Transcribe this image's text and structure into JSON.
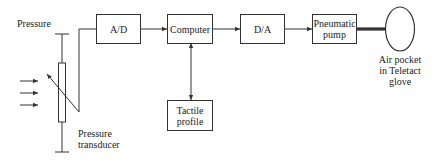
{
  "diagram": {
    "type": "block-diagram",
    "labels": {
      "pressure": "Pressure",
      "transducer_line1": "Pressure",
      "transducer_line2": "transducer",
      "airpocket_line1": "Air pocket",
      "airpocket_line2": "in Teletact",
      "airpocket_line3": "glove"
    },
    "blocks": {
      "ad": "A/D",
      "computer": "Computer",
      "da": "D/A",
      "pump_line1": "Pneumatic",
      "pump_line2": "pump",
      "tactile_line1": "Tactile",
      "tactile_line2": "profile"
    },
    "connections": [
      {
        "from": "Pressure transducer",
        "to": "A/D"
      },
      {
        "from": "A/D",
        "to": "Computer"
      },
      {
        "from": "Computer",
        "to": "D/A"
      },
      {
        "from": "D/A",
        "to": "Pneumatic pump"
      },
      {
        "from": "Pneumatic pump",
        "to": "Air pocket in Teletact glove"
      },
      {
        "from": "Computer",
        "to": "Tactile profile",
        "bidirectional": true
      }
    ]
  }
}
